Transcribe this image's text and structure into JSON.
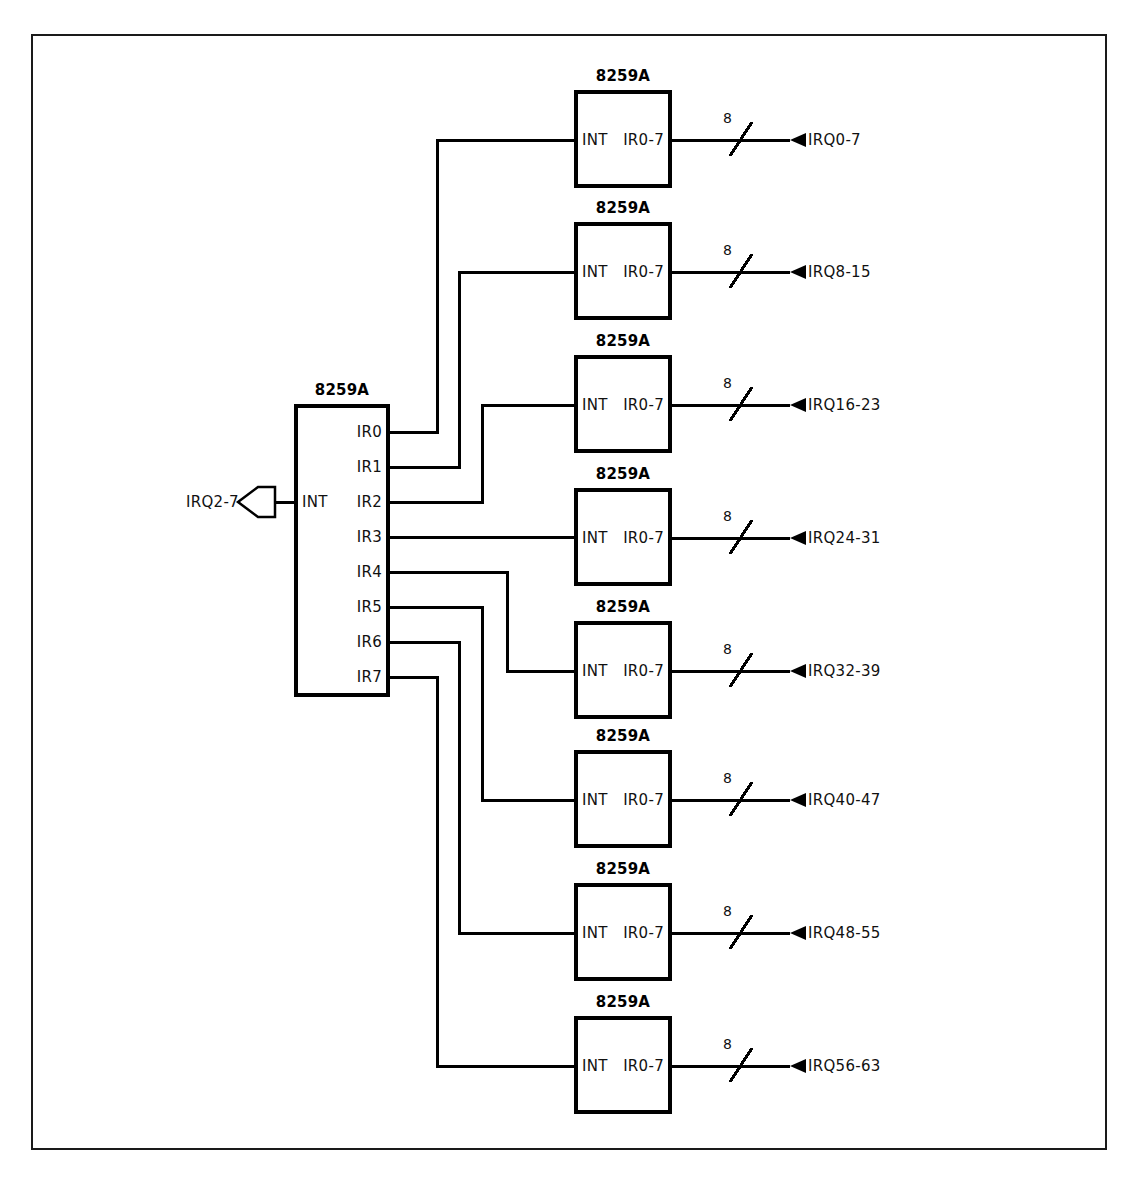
{
  "diagram": {
    "colors": {
      "line": "#000000",
      "frame": "#1a1a1a",
      "background": "#ffffff",
      "text": "#111111"
    },
    "frame": {
      "x": 31,
      "y": 34,
      "width": 1076,
      "height": 1116
    },
    "master": {
      "chip_label": "8259A",
      "int_pin_label": "INT",
      "box": {
        "x": 294,
        "y": 404,
        "width": 96,
        "height": 293
      },
      "input": {
        "label": "IRQ2-7",
        "connector": "flag-arrow-left"
      },
      "ir_pins": [
        {
          "label": "IR0",
          "y": 432
        },
        {
          "label": "IR1",
          "y": 467
        },
        {
          "label": "IR2",
          "y": 502
        },
        {
          "label": "IR3",
          "y": 537
        },
        {
          "label": "IR4",
          "y": 572
        },
        {
          "label": "IR5",
          "y": 607
        },
        {
          "label": "IR6",
          "y": 642
        },
        {
          "label": "IR7",
          "y": 677
        }
      ]
    },
    "slaves": [
      {
        "chip_label": "8259A",
        "int_pin_label": "INT",
        "out_pin_label": "IR0-7",
        "bus_width": "8",
        "bus_label": "IRQ0-7",
        "box_y": 90,
        "int_y": 140,
        "from_pin": "IR0",
        "riser_x": 437
      },
      {
        "chip_label": "8259A",
        "int_pin_label": "INT",
        "out_pin_label": "IR0-7",
        "bus_width": "8",
        "bus_label": "IRQ8-15",
        "box_y": 222,
        "int_y": 272,
        "from_pin": "IR1",
        "riser_x": 459
      },
      {
        "chip_label": "8259A",
        "int_pin_label": "INT",
        "out_pin_label": "IR0-7",
        "bus_width": "8",
        "bus_label": "IRQ16-23",
        "box_y": 355,
        "int_y": 405,
        "from_pin": "IR2",
        "riser_x": 482
      },
      {
        "chip_label": "8259A",
        "int_pin_label": "INT",
        "out_pin_label": "IR0-7",
        "bus_width": "8",
        "bus_label": "IRQ24-31",
        "box_y": 488,
        "int_y": 538,
        "from_pin": "IR3",
        "riser_x": 0
      },
      {
        "chip_label": "8259A",
        "int_pin_label": "INT",
        "out_pin_label": "IR0-7",
        "bus_width": "8",
        "bus_label": "IRQ32-39",
        "box_y": 621,
        "int_y": 671,
        "from_pin": "IR4",
        "riser_x": 507
      },
      {
        "chip_label": "8259A",
        "int_pin_label": "INT",
        "out_pin_label": "IR0-7",
        "bus_width": "8",
        "bus_label": "IRQ40-47",
        "box_y": 750,
        "int_y": 800,
        "from_pin": "IR5",
        "riser_x": 482
      },
      {
        "chip_label": "8259A",
        "int_pin_label": "INT",
        "out_pin_label": "IR0-7",
        "bus_width": "8",
        "bus_label": "IRQ48-55",
        "box_y": 883,
        "int_y": 933,
        "from_pin": "IR6",
        "riser_x": 459
      },
      {
        "chip_label": "8259A",
        "int_pin_label": "INT",
        "out_pin_label": "IR0-7",
        "bus_width": "8",
        "bus_label": "IRQ56-63",
        "box_y": 1016,
        "int_y": 1066,
        "from_pin": "IR7",
        "riser_x": 437
      }
    ],
    "slave_box": {
      "x": 574,
      "width": 98,
      "height": 98
    },
    "bus": {
      "slash_x": 740,
      "arrow_x": 795,
      "label_x": 808,
      "line_end_x": 790
    }
  }
}
